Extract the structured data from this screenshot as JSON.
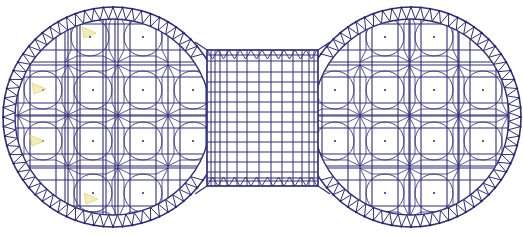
{
  "diagram": {
    "type": "structural-plan",
    "colors": {
      "background": "#ffffff",
      "member": "#2e2e7a",
      "node": "#24245e",
      "support_marker": "#e8e27a"
    },
    "left_dome": {
      "cx": 113,
      "cy": 117,
      "r_outer": 110,
      "r_inner": 98
    },
    "right_dome": {
      "cx": 411,
      "cy": 117,
      "r_outer": 110,
      "r_inner": 98
    },
    "connector": {
      "x": 207,
      "y": 50,
      "width": 111,
      "height": 136
    },
    "left_units": [
      {
        "x": 90,
        "y": 37
      },
      {
        "x": 143,
        "y": 37
      },
      {
        "x": 43,
        "y": 90
      },
      {
        "x": 93,
        "y": 90
      },
      {
        "x": 143,
        "y": 90
      },
      {
        "x": 193,
        "y": 90
      },
      {
        "x": 43,
        "y": 141
      },
      {
        "x": 93,
        "y": 141
      },
      {
        "x": 143,
        "y": 141
      },
      {
        "x": 193,
        "y": 141
      },
      {
        "x": 93,
        "y": 193
      },
      {
        "x": 143,
        "y": 193
      }
    ],
    "right_units": [
      {
        "x": 385,
        "y": 37
      },
      {
        "x": 434,
        "y": 37
      },
      {
        "x": 335,
        "y": 90
      },
      {
        "x": 385,
        "y": 90
      },
      {
        "x": 434,
        "y": 90
      },
      {
        "x": 483,
        "y": 90
      },
      {
        "x": 335,
        "y": 141
      },
      {
        "x": 385,
        "y": 141
      },
      {
        "x": 434,
        "y": 141
      },
      {
        "x": 483,
        "y": 141
      },
      {
        "x": 385,
        "y": 193
      },
      {
        "x": 434,
        "y": 193
      }
    ],
    "support_markers": [
      {
        "x": 90,
        "y": 32
      },
      {
        "x": 40,
        "y": 88
      },
      {
        "x": 38,
        "y": 140
      },
      {
        "x": 92,
        "y": 198
      }
    ]
  }
}
